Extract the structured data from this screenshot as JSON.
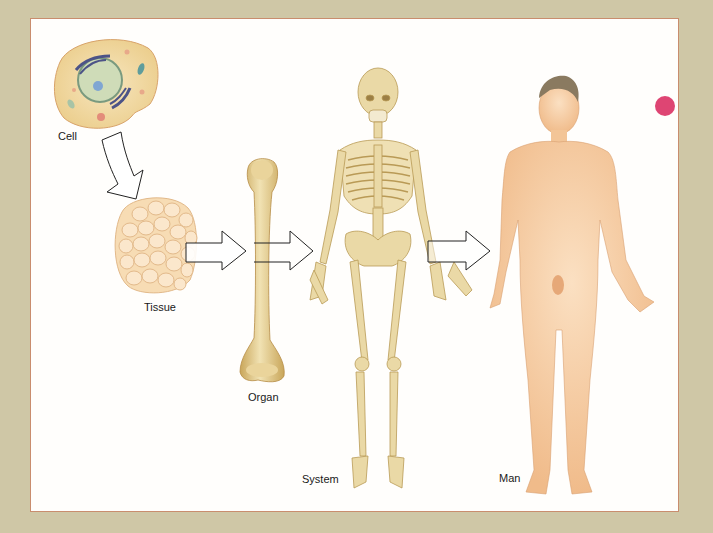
{
  "diagram": {
    "stages": [
      {
        "id": "cell",
        "label": "Cell"
      },
      {
        "id": "tissue",
        "label": "Tissue"
      },
      {
        "id": "organ",
        "label": "Organ"
      },
      {
        "id": "system",
        "label": "System"
      },
      {
        "id": "man",
        "label": "Man"
      }
    ],
    "arrows": [
      {
        "from": "Cell",
        "to": "Tissue",
        "style": "curved-outline"
      },
      {
        "from": "Tissue",
        "to": "Organ",
        "style": "block-outline"
      },
      {
        "from": "Organ",
        "to": "System",
        "style": "block-outline"
      },
      {
        "from": "System",
        "to": "Man",
        "style": "block-outline"
      }
    ],
    "colors": {
      "background": "#cfc7a6",
      "panel": "#fffefc",
      "panel_border": "#c98d6e",
      "bone": "#e8d6a2",
      "skin": "#f6cfa6",
      "cell": "#f3dba8",
      "mark": "#d8245a"
    }
  }
}
